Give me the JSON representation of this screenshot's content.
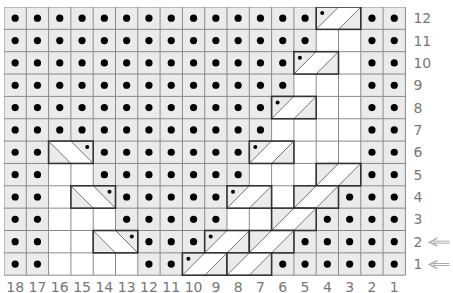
{
  "chart": {
    "columns": 18,
    "rows": 12,
    "column_labels": [
      "18",
      "17",
      "16",
      "15",
      "14",
      "13",
      "12",
      "11",
      "10",
      "9",
      "8",
      "7",
      "6",
      "5",
      "4",
      "3",
      "2",
      "1"
    ],
    "row_labels": [
      "12",
      "11",
      "10",
      "9",
      "8",
      "7",
      "6",
      "5",
      "4",
      "3",
      "2",
      "1"
    ],
    "arrow_rows": [
      "2",
      "1"
    ],
    "legend_codes": {
      "P": "purl (gray cell with dot)",
      "K": "knit (white cell)",
      "A": "right-leaning cable box start with dot",
      "a": "right-leaning cable box continuation",
      "B": "right-leaning cable box start without dot",
      "b": "right-leaning cable box continuation",
      "l": "left-leaning cable box start",
      "L": "left-leaning cable box end with dot"
    },
    "grid_rows": [
      "PPPPPPPPPPPPPPAaPP",
      "PPPPPPPPPPPPPPKKPP",
      "PPPPPPPPPPPPPAaKPP",
      "PPPPPPPPPPPPPKKKPP",
      "PPPPPPPPPPPPAaKKPP",
      "PPPPPPPPPPPPKKKKPP",
      "PPlLPPPPPPPAaKKKPP",
      "PPKKPPPPPPPKKKBbPP",
      "PPKlLPPPPPAaKBbPPP",
      "PPKKKPPPPPKKBbPPPP",
      "PPKKlLPPPAaBbPPPPP",
      "PPKKKKPPAaBbPPPPPP"
    ],
    "colors": {
      "purl_bg": "#ebebeb",
      "knit_bg": "#ffffff",
      "grid_line": "#8a8a8a",
      "box_border": "#333333",
      "dot": "#000000",
      "label": "#777777",
      "arrow": "#aaaaaa"
    }
  }
}
